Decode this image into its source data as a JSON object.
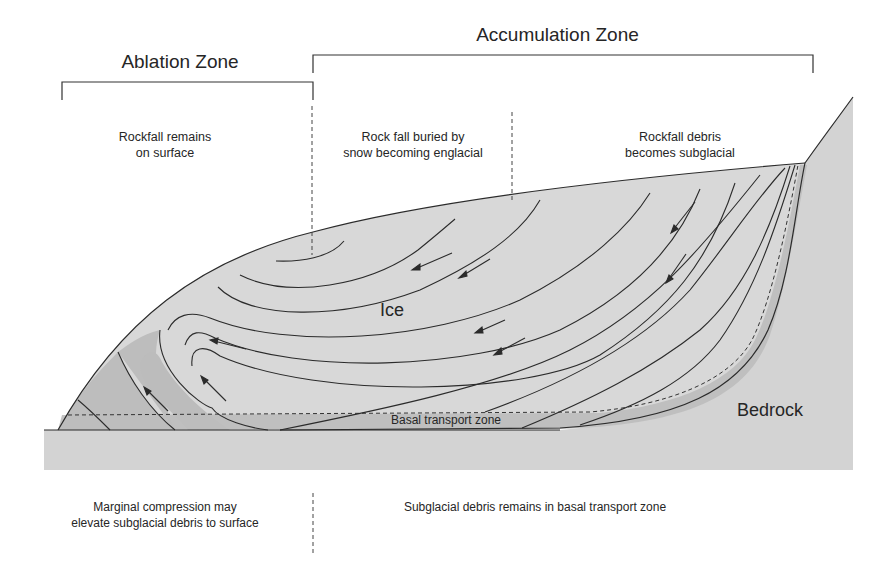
{
  "zones": {
    "ablation": {
      "title": "Ablation Zone"
    },
    "accumulation": {
      "title": "Accumulation Zone"
    }
  },
  "top_notes": [
    {
      "id": "rockfall-surface",
      "line1": "Rockfall remains",
      "line2": "on surface"
    },
    {
      "id": "rockfall-englacial",
      "line1": "Rock fall buried by",
      "line2": "snow becoming englacial"
    },
    {
      "id": "rockfall-subglacial",
      "line1": "Rockfall debris",
      "line2": "becomes subglacial"
    }
  ],
  "labels": {
    "ice": "Ice",
    "bedrock": "Bedrock",
    "basal_zone": "Basal transport zone"
  },
  "bottom_notes": [
    {
      "id": "marginal-compression",
      "line1": "Marginal compression may",
      "line2": "elevate subglacial debris to surface"
    },
    {
      "id": "subglacial-remains",
      "line1": "Subglacial debris remains in basal transport zone",
      "line2": ""
    }
  ],
  "colors": {
    "ice_fill": "#d6d6d6",
    "bedrock_fill": "#d3d3d3",
    "debris_fill": "#b9b9b9",
    "line": "#2b2b2b",
    "text": "#262626"
  }
}
